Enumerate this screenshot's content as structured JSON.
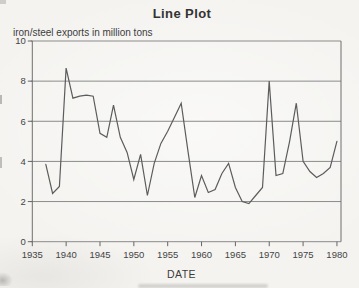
{
  "page": {
    "background_color": "#f4f3f0",
    "text_color": "#3c3c3c"
  },
  "chart": {
    "title": "Line Plot",
    "y_axis_caption": "iron/steel exports in million tons",
    "x_axis_label": "DATE",
    "line_color": "#5c5c5c",
    "grid_color": "#8b8b8b",
    "axis_color": "#6e6e6e",
    "tick_color": "#666666"
  },
  "chart_data": {
    "type": "line",
    "title": "Line Plot",
    "xlabel": "DATE",
    "ylabel": "iron/steel exports in million tons",
    "xlim": [
      1935,
      1980.6
    ],
    "ylim": [
      0,
      10
    ],
    "xticks": [
      1935,
      1940,
      1945,
      1950,
      1955,
      1960,
      1965,
      1970,
      1975,
      1980
    ],
    "yticks": [
      0,
      2,
      4,
      6,
      8,
      10
    ],
    "grid": "horizontal",
    "legend": "none",
    "x": [
      1937,
      1938,
      1939,
      1940,
      1941,
      1942,
      1943,
      1944,
      1945,
      1946,
      1947,
      1948,
      1949,
      1950,
      1951,
      1952,
      1953,
      1954,
      1955,
      1956,
      1957,
      1958,
      1959,
      1960,
      1961,
      1962,
      1963,
      1964,
      1965,
      1966,
      1967,
      1968,
      1969,
      1970,
      1971,
      1972,
      1973,
      1974,
      1975,
      1976,
      1977,
      1978,
      1979,
      1980
    ],
    "values": [
      3.85,
      2.4,
      2.75,
      8.65,
      7.15,
      7.25,
      7.3,
      7.25,
      5.4,
      5.2,
      6.8,
      5.2,
      4.45,
      3.1,
      4.35,
      2.3,
      3.9,
      4.9,
      5.5,
      6.2,
      6.9,
      4.5,
      2.2,
      3.3,
      2.45,
      2.6,
      3.4,
      3.9,
      2.7,
      2.0,
      1.9,
      2.3,
      2.7,
      8.0,
      3.3,
      3.4,
      5.0,
      6.9,
      4.0,
      3.5,
      3.2,
      3.4,
      3.7,
      5.0
    ]
  }
}
